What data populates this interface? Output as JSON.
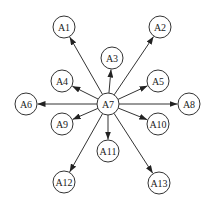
{
  "diagram": {
    "type": "star-graph",
    "center": "A7",
    "colors": {
      "stroke": "#333333",
      "text": "#222222",
      "fill": "#ffffff",
      "background": "#ffffff"
    },
    "node_radius": 11,
    "nodes": [
      {
        "id": "A1",
        "label": "A1",
        "x": 64,
        "y": 27
      },
      {
        "id": "A2",
        "label": "A2",
        "x": 160,
        "y": 27
      },
      {
        "id": "A3",
        "label": "A3",
        "x": 112,
        "y": 58
      },
      {
        "id": "A4",
        "label": "A4",
        "x": 62,
        "y": 81
      },
      {
        "id": "A5",
        "label": "A5",
        "x": 158,
        "y": 81
      },
      {
        "id": "A6",
        "label": "A6",
        "x": 26,
        "y": 104
      },
      {
        "id": "A7",
        "label": "A7",
        "x": 108,
        "y": 104
      },
      {
        "id": "A8",
        "label": "A8",
        "x": 189,
        "y": 104
      },
      {
        "id": "A9",
        "label": "A9",
        "x": 62,
        "y": 124
      },
      {
        "id": "A10",
        "label": "A10",
        "x": 158,
        "y": 124
      },
      {
        "id": "A11",
        "label": "A11",
        "x": 108,
        "y": 151
      },
      {
        "id": "A12",
        "label": "A12",
        "x": 64,
        "y": 182
      },
      {
        "id": "A13",
        "label": "A13",
        "x": 159,
        "y": 183
      }
    ],
    "edges": [
      {
        "from": "A7",
        "to": "A1"
      },
      {
        "from": "A7",
        "to": "A2"
      },
      {
        "from": "A7",
        "to": "A3"
      },
      {
        "from": "A7",
        "to": "A4"
      },
      {
        "from": "A7",
        "to": "A5"
      },
      {
        "from": "A7",
        "to": "A6"
      },
      {
        "from": "A7",
        "to": "A8"
      },
      {
        "from": "A7",
        "to": "A9"
      },
      {
        "from": "A7",
        "to": "A10"
      },
      {
        "from": "A7",
        "to": "A11"
      },
      {
        "from": "A7",
        "to": "A12"
      },
      {
        "from": "A7",
        "to": "A13"
      }
    ]
  }
}
